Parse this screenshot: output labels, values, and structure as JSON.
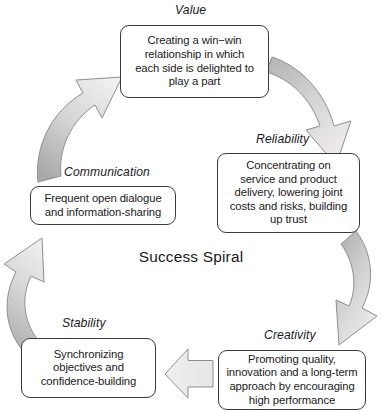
{
  "diagram": {
    "title": "Success Spiral",
    "type": "cycle",
    "palette": {
      "box_border": "#3b3b3b",
      "box_fill": "#ffffff",
      "arrow_fill_dark": "#b0b0b0",
      "arrow_fill_light": "#e8e8e8",
      "arrow_stroke": "#8c8c8c",
      "text": "#1a1a1a",
      "background": "#ffffff"
    },
    "nodes": [
      {
        "id": "value",
        "label": "Value",
        "text": "Creating a win−win\nrelationship in which\neach side is delighted to\nplay a part"
      },
      {
        "id": "reliability",
        "label": "Reliability",
        "text": "Concentrating on\nservice and product\ndelivery, lowering joint\ncosts and risks, building\nup trust"
      },
      {
        "id": "creativity",
        "label": "Creativity",
        "text": "Promoting quality,\ninnovation and a long-term\napproach by encouraging\nhigh performance"
      },
      {
        "id": "stability",
        "label": "Stability",
        "text": "Synchronizing\nobjectives and\nconfidence-building"
      },
      {
        "id": "communication",
        "label": "Communication",
        "text": "Frequent open dialogue\nand information-sharing"
      }
    ],
    "arrows": [
      {
        "id": "value-to-reliability",
        "from": "value",
        "to": "reliability",
        "shape": "curved-ribbon"
      },
      {
        "id": "reliability-to-creativity",
        "from": "reliability",
        "to": "creativity",
        "shape": "curved-ribbon"
      },
      {
        "id": "creativity-to-stability",
        "from": "creativity",
        "to": "stability",
        "shape": "block-arrow-left"
      },
      {
        "id": "stability-to-communication",
        "from": "stability",
        "to": "communication",
        "shape": "curved-ribbon"
      },
      {
        "id": "communication-to-value",
        "from": "communication",
        "to": "value",
        "shape": "curved-ribbon"
      }
    ]
  }
}
